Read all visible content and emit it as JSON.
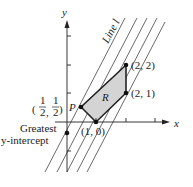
{
  "axes": {
    "x_label": "x",
    "y_label": "y"
  },
  "line_label": "Line l",
  "region_label": "R",
  "points": {
    "p_label": "P",
    "p_frac_num1": "1",
    "p_frac_den1": "2",
    "p_frac_num2": "1",
    "p_frac_den2": "2",
    "p_comma": ",",
    "v1": "(2, 2)",
    "v2": "(2, 1)",
    "v3": "(1, 0)"
  },
  "annotation": {
    "line1": "Greatest",
    "line2": "y-intercept"
  },
  "colors": {
    "region_fill": "#d4d4d4",
    "stroke": "#222222"
  }
}
